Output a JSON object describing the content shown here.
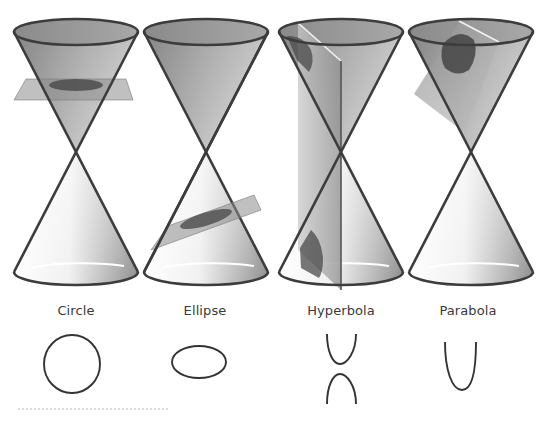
{
  "figure": {
    "panels": [
      {
        "id": "circle",
        "label": "Circle",
        "cx": 76,
        "label_x": 76,
        "plane": "horizontal"
      },
      {
        "id": "ellipse",
        "label": "Ellipse",
        "cx": 206,
        "label_x": 205,
        "plane": "tilted"
      },
      {
        "id": "hyperbola",
        "label": "Hyperbola",
        "cx": 341,
        "label_x": 341,
        "plane": "vertical"
      },
      {
        "id": "parabola",
        "label": "Parabola",
        "cx": 471,
        "label_x": 468,
        "plane": "parallel-to-side"
      }
    ]
  },
  "colors": {
    "outline": "#3c3c3c",
    "cone_dark": "#8e8e8e",
    "cone_light": "#f4f4f4",
    "plane": "#9a9a9a",
    "section": "#4a4a4a",
    "label": "#3a3a3a"
  }
}
